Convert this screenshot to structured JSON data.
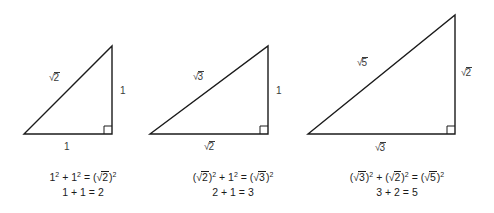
{
  "figure": {
    "kind": "pythagorean-spiral-triangles",
    "background_color": "#ffffff",
    "line_color": "#1b1b1b",
    "label_color": "#3a3a3a"
  },
  "triangles": [
    {
      "id": "triangle-1",
      "hypotenuse_label": "√2",
      "vertical_leg_label": "1",
      "base_label": "1",
      "right_angle_marker": true,
      "geometry": {
        "left_vertex": [
          24,
          134
        ],
        "right_angle_vertex": [
          112,
          134
        ],
        "apex": [
          112,
          46
        ]
      },
      "caption": {
        "line1": "1² + 1² = (√2)²",
        "line2": "1 + 1 = 2"
      }
    },
    {
      "id": "triangle-2",
      "hypotenuse_label": "√3",
      "vertical_leg_label": "1",
      "base_label": "√2",
      "right_angle_marker": true,
      "geometry": {
        "left_vertex": [
          150,
          134
        ],
        "right_angle_vertex": [
          268,
          134
        ],
        "apex": [
          268,
          46
        ]
      },
      "caption": {
        "line1": "(√2)² + 1² = (√3)²",
        "line2": "2 + 1 = 3"
      }
    },
    {
      "id": "triangle-3",
      "hypotenuse_label": "√5",
      "vertical_leg_label": "√2",
      "base_label": "√3",
      "right_angle_marker": true,
      "geometry": {
        "left_vertex": [
          308,
          134
        ],
        "right_angle_vertex": [
          455,
          134
        ],
        "apex": [
          455,
          15
        ]
      },
      "caption": {
        "line1": "(√3)² + (√2)² = (√5)²",
        "line2": "3 + 2 = 5"
      }
    }
  ]
}
